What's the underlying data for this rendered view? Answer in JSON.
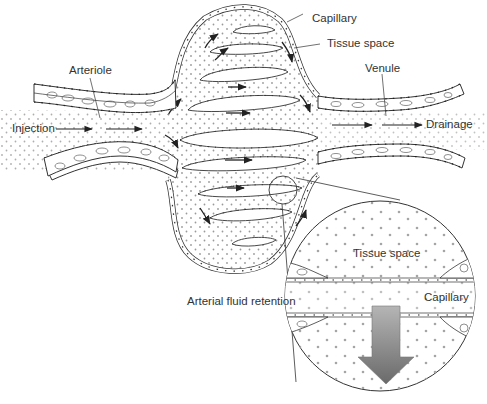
{
  "diagram": {
    "type": "biological-illustration",
    "colors": {
      "line": "#333333",
      "dots": "#999999",
      "arrow_fill_top": "#b0b0b0",
      "arrow_fill_bottom": "#6a6a6a",
      "background": "#ffffff"
    }
  },
  "labels": {
    "arteriole": "Arteriole",
    "injection": "Injection",
    "capillary_top": "Capillary",
    "tissue_space_top": "Tissue space",
    "venule": "Venule",
    "drainage": "Drainage",
    "arterial_fluid_retention": "Arterial fluid retention",
    "inset_tissue_space": "Tissue space",
    "inset_capillary": "Capillary"
  },
  "flow": {
    "inlet_direction": "left-to-right",
    "outlet_direction": "left-to-right",
    "inset_arrow_direction": "down"
  }
}
